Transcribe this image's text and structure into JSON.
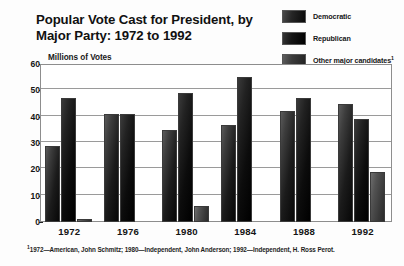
{
  "chart_data": {
    "type": "bar",
    "title": "Popular Vote Cast for President, by Major Party: 1972 to 1992",
    "title_line1": "Popular Vote Cast for President, by",
    "title_line2": "Major Party: 1972 to 1992",
    "xlabel": "",
    "ylabel": "Millions of Votes",
    "ylim": [
      0,
      60
    ],
    "yticks": [
      0,
      10,
      20,
      30,
      40,
      50,
      60
    ],
    "grid": true,
    "legend_position": "top-right",
    "categories": [
      "1972",
      "1976",
      "1980",
      "1984",
      "1988",
      "1992"
    ],
    "series": [
      {
        "name": "Democratic",
        "color": "#1b1b1b",
        "values": [
          29,
          41,
          35,
          37,
          42,
          45
        ]
      },
      {
        "name": "Republican",
        "color": "#0c0c0c",
        "values": [
          47,
          41,
          49,
          55,
          47,
          39
        ]
      },
      {
        "name": "Other major candidates",
        "color": "#4a4a4a",
        "values": [
          1,
          0,
          6,
          0,
          0,
          19
        ]
      }
    ],
    "annotations": [
      "1972—American, John Schmitz; 1980—Independent, John Anderson; 1992—Independent, H. Ross Perot."
    ]
  },
  "legend": {
    "items": [
      {
        "label": "Democratic",
        "superscript": ""
      },
      {
        "label": "Republican",
        "superscript": ""
      },
      {
        "label": "Other major candidates",
        "superscript": "1"
      }
    ]
  },
  "footnote": {
    "marker": "1",
    "text": "1972—American, John Schmitz; 1980—Independent, John Anderson; 1992—Independent, H. Ross Perot."
  }
}
